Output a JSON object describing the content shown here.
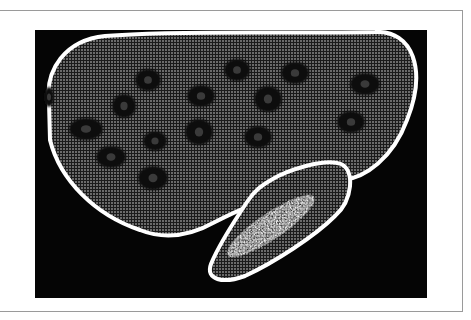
{
  "figure": {
    "frame_color": "#9a9a9a",
    "background_color": "#ffffff",
    "panel_color": "#050505",
    "outline_color": "#ffffff",
    "tissue_color": "#5a5a5a",
    "grid_color": "#1a1a1a",
    "lesion_color": "#0c0c0c",
    "bright_region_color": "#e8e8e8"
  },
  "scan": {
    "organ_main": {
      "label": "liver",
      "path": "M 14 72 C 10 40 30 10 70 6 C 150 0 250 4 340 2 C 378 0 392 40 372 90 C 358 128 330 148 308 150 C 285 150 270 154 250 160 C 232 170 210 176 180 192 C 155 206 130 210 105 200 C 60 185 25 150 15 110 Z"
    },
    "organ_secondary": {
      "label": "adjacent organ",
      "path": "M 236 150 C 252 140 290 128 306 134 C 320 140 318 170 300 186 C 280 206 240 232 210 246 C 188 254 170 250 176 234 C 184 214 200 190 212 172 C 220 160 226 156 236 150 Z",
      "bright_region": {
        "cx": 236,
        "cy": 196,
        "rx": 52,
        "ry": 13,
        "rotate": -34
      }
    },
    "lesions": [
      {
        "cx": 14,
        "cy": 67,
        "rx": 5,
        "ry": 10
      },
      {
        "cx": 113,
        "cy": 50,
        "rx": 13,
        "ry": 11
      },
      {
        "cx": 89,
        "cy": 76,
        "rx": 12,
        "ry": 12
      },
      {
        "cx": 51,
        "cy": 99,
        "rx": 17,
        "ry": 11
      },
      {
        "cx": 76,
        "cy": 127,
        "rx": 15,
        "ry": 11
      },
      {
        "cx": 120,
        "cy": 111,
        "rx": 12,
        "ry": 10
      },
      {
        "cx": 118,
        "cy": 148,
        "rx": 15,
        "ry": 12
      },
      {
        "cx": 166,
        "cy": 66,
        "rx": 14,
        "ry": 11
      },
      {
        "cx": 164,
        "cy": 102,
        "rx": 14,
        "ry": 13
      },
      {
        "cx": 202,
        "cy": 40,
        "rx": 13,
        "ry": 11
      },
      {
        "cx": 233,
        "cy": 69,
        "rx": 14,
        "ry": 13
      },
      {
        "cx": 223,
        "cy": 107,
        "rx": 14,
        "ry": 11
      },
      {
        "cx": 260,
        "cy": 43,
        "rx": 14,
        "ry": 11
      },
      {
        "cx": 330,
        "cy": 54,
        "rx": 15,
        "ry": 11
      },
      {
        "cx": 316,
        "cy": 92,
        "rx": 14,
        "ry": 11
      }
    ]
  }
}
